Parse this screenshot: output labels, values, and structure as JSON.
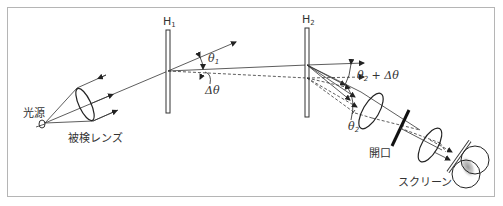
{
  "diagram": {
    "title": "",
    "labels": {
      "light_source": "光源",
      "test_lens": "被検レンズ",
      "hologram1": "H",
      "hologram1_sub": "1",
      "hologram2": "H",
      "hologram2_sub": "2",
      "theta1": "θ",
      "theta1_sub": "1",
      "delta_theta": "Δθ",
      "theta2_plus": "θ",
      "theta2_plus_sub": "2",
      "theta2_plus_suffix": " + Δθ",
      "theta2": "θ",
      "theta2_sub": "2",
      "aperture": "開口",
      "screen": "スクリーン"
    },
    "components": [
      {
        "id": "light-source",
        "label": "光源"
      },
      {
        "id": "test-lens",
        "label": "被検レンズ"
      },
      {
        "id": "hologram-h1",
        "label": "H1"
      },
      {
        "id": "hologram-h2",
        "label": "H2"
      },
      {
        "id": "aperture",
        "label": "開口"
      },
      {
        "id": "screen",
        "label": "スクリーン"
      }
    ],
    "colors": {
      "line": "#333333",
      "frame": "#b5b5b5"
    }
  }
}
